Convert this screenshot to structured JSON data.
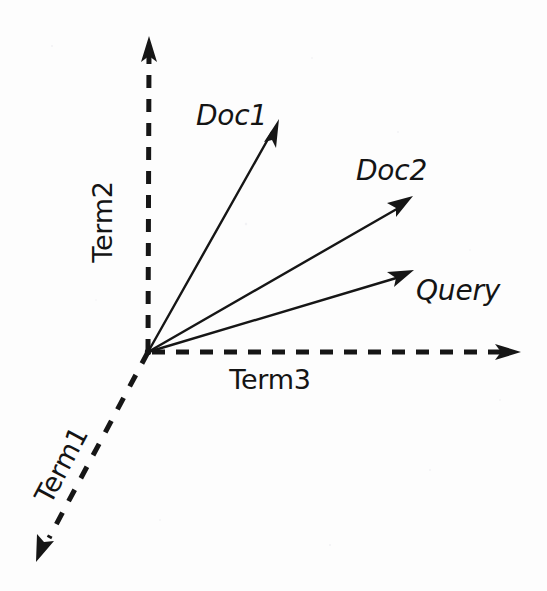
{
  "figure": {
    "kind": "vector-space-model-diagram",
    "background_color": "#fdfdfd",
    "ink_color": "#161616",
    "width": 547,
    "height": 591
  },
  "axes": [
    {
      "id": "term1",
      "label": "Term1",
      "style": "dashed",
      "direction": "down-left",
      "label_rotation_deg": -45,
      "origin": [
        148,
        352
      ],
      "tip": [
        37,
        557
      ],
      "label_position": [
        63,
        466
      ]
    },
    {
      "id": "term2",
      "label": "Term2",
      "style": "dashed",
      "direction": "up",
      "label_rotation_deg": -90,
      "origin": [
        148,
        352
      ],
      "tip": [
        149,
        38
      ],
      "label_position": [
        104,
        222
      ]
    },
    {
      "id": "term3",
      "label": "Term3",
      "style": "dashed",
      "direction": "right",
      "label_rotation_deg": 0,
      "origin": [
        148,
        352
      ],
      "tip": [
        519,
        352
      ],
      "label_position": [
        270,
        381
      ]
    }
  ],
  "vectors": [
    {
      "id": "doc1",
      "label": "Doc1",
      "style": "solid",
      "origin": [
        148,
        352
      ],
      "tip": [
        278,
        122
      ],
      "label_position": [
        196,
        117
      ],
      "label_anchor": "start"
    },
    {
      "id": "doc2",
      "label": "Doc2",
      "style": "solid",
      "origin": [
        148,
        352
      ],
      "tip": [
        411,
        198
      ],
      "label_position": [
        356,
        172
      ],
      "label_anchor": "start"
    },
    {
      "id": "query",
      "label": "Query",
      "style": "solid",
      "origin": [
        148,
        352
      ],
      "tip": [
        412,
        271
      ],
      "label_position": [
        416,
        292
      ],
      "label_anchor": "start"
    }
  ],
  "origin_point": {
    "label": "",
    "coords": [
      148,
      352
    ]
  }
}
